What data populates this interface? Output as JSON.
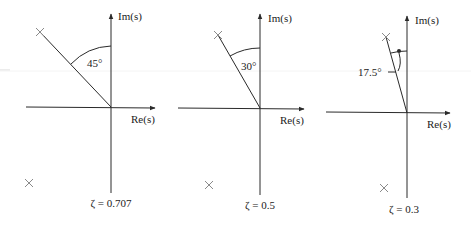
{
  "figure": {
    "axis_labels": {
      "imag": "Im(s)",
      "real": "Re(s)"
    },
    "panels": [
      {
        "id": "zeta-0707",
        "angle_label": "45°",
        "angle_deg": 45,
        "zeta_label": "ζ = 0.707",
        "zeta": 0.707
      },
      {
        "id": "zeta-05",
        "angle_label": "30°",
        "angle_deg": 30,
        "zeta_label": "ζ = 0.5",
        "zeta": 0.5
      },
      {
        "id": "zeta-03",
        "angle_label": "17.5°",
        "angle_deg": 17.5,
        "zeta_label": "ζ = 0.3",
        "zeta": 0.3
      }
    ],
    "colors": {
      "ink": "#2a2a2a",
      "pole": "#8a8a8a",
      "background": "#ffffff"
    }
  }
}
